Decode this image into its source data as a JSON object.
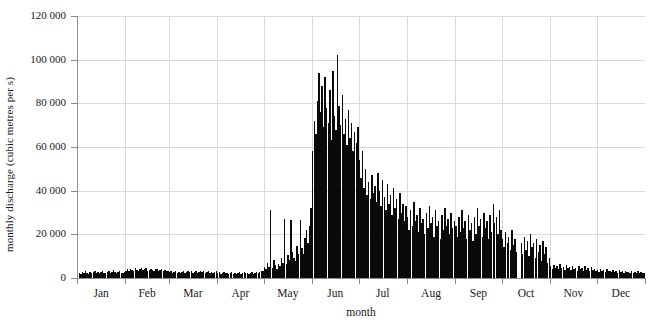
{
  "chart_data": {
    "type": "bar",
    "title": "",
    "subtitle": "",
    "xlabel": "month",
    "ylabel": "monthly discharge (cubic metres per s)",
    "xlim": [
      0,
      365
    ],
    "ylim": [
      0,
      120000
    ],
    "grid": true,
    "legend": null,
    "y_ticks": [
      0,
      20000,
      40000,
      60000,
      80000,
      100000,
      120000
    ],
    "y_tick_labels": [
      "0",
      "20 000",
      "40 000",
      "60 000",
      "80 000",
      "100 000",
      "120 000"
    ],
    "x_tick_labels": [
      "Jan",
      "Feb",
      "Mar",
      "Apr",
      "May",
      "Jun",
      "Jul",
      "Aug",
      "Sep",
      "Oct",
      "Nov",
      "Dec"
    ],
    "x_tick_positions_days": [
      15,
      46,
      74,
      105,
      135,
      166,
      196,
      227,
      258,
      288,
      319,
      349
    ],
    "month_boundaries_days": [
      0,
      31,
      59,
      90,
      120,
      151,
      181,
      212,
      243,
      273,
      304,
      334,
      365
    ],
    "bar_color": "#0a0a0a",
    "grid_color": "#d9d9d9",
    "axis_color": "#909090",
    "annotations": [
      "isolated spikes in early and mid May reaching ~31 000 and ~27 000",
      "peak discharge ~102 000 in early June",
      "narrow data gap in early October"
    ],
    "categories": [
      "1-Jan",
      "2-Jan",
      "3-Jan",
      "4-Jan",
      "5-Jan",
      "6-Jan",
      "7-Jan",
      "8-Jan",
      "9-Jan",
      "10-Jan",
      "11-Jan",
      "12-Jan",
      "13-Jan",
      "14-Jan",
      "15-Jan",
      "16-Jan",
      "17-Jan",
      "18-Jan",
      "19-Jan",
      "20-Jan",
      "21-Jan",
      "22-Jan",
      "23-Jan",
      "24-Jan",
      "25-Jan",
      "26-Jan",
      "27-Jan",
      "28-Jan",
      "29-Jan",
      "30-Jan",
      "31-Jan",
      "1-Feb",
      "2-Feb",
      "3-Feb",
      "4-Feb",
      "5-Feb",
      "6-Feb",
      "7-Feb",
      "8-Feb",
      "9-Feb",
      "10-Feb",
      "11-Feb",
      "12-Feb",
      "13-Feb",
      "14-Feb",
      "15-Feb",
      "16-Feb",
      "17-Feb",
      "18-Feb",
      "19-Feb",
      "20-Feb",
      "21-Feb",
      "22-Feb",
      "23-Feb",
      "24-Feb",
      "25-Feb",
      "26-Feb",
      "27-Feb",
      "28-Feb",
      "1-Mar",
      "2-Mar",
      "3-Mar",
      "4-Mar",
      "5-Mar",
      "6-Mar",
      "7-Mar",
      "8-Mar",
      "9-Mar",
      "10-Mar",
      "11-Mar",
      "12-Mar",
      "13-Mar",
      "14-Mar",
      "15-Mar",
      "16-Mar",
      "17-Mar",
      "18-Mar",
      "19-Mar",
      "20-Mar",
      "21-Mar",
      "22-Mar",
      "23-Mar",
      "24-Mar",
      "25-Mar",
      "26-Mar",
      "27-Mar",
      "28-Mar",
      "29-Mar",
      "30-Mar",
      "31-Mar",
      "1-Apr",
      "2-Apr",
      "3-Apr",
      "4-Apr",
      "5-Apr",
      "6-Apr",
      "7-Apr",
      "8-Apr",
      "9-Apr",
      "10-Apr",
      "11-Apr",
      "12-Apr",
      "13-Apr",
      "14-Apr",
      "15-Apr",
      "16-Apr",
      "17-Apr",
      "18-Apr",
      "19-Apr",
      "20-Apr",
      "21-Apr",
      "22-Apr",
      "23-Apr",
      "24-Apr",
      "25-Apr",
      "26-Apr",
      "27-Apr",
      "28-Apr",
      "29-Apr",
      "30-Apr",
      "1-May",
      "2-May",
      "3-May",
      "4-May",
      "5-May",
      "6-May",
      "7-May",
      "8-May",
      "9-May",
      "10-May",
      "11-May",
      "12-May",
      "13-May",
      "14-May",
      "15-May",
      "16-May",
      "17-May",
      "18-May",
      "19-May",
      "20-May",
      "21-May",
      "22-May",
      "23-May",
      "24-May",
      "25-May",
      "26-May",
      "27-May",
      "28-May",
      "29-May",
      "30-May",
      "31-May",
      "1-Jun",
      "2-Jun",
      "3-Jun",
      "4-Jun",
      "5-Jun",
      "6-Jun",
      "7-Jun",
      "8-Jun",
      "9-Jun",
      "10-Jun",
      "11-Jun",
      "12-Jun",
      "13-Jun",
      "14-Jun",
      "15-Jun",
      "16-Jun",
      "17-Jun",
      "18-Jun",
      "19-Jun",
      "20-Jun",
      "21-Jun",
      "22-Jun",
      "23-Jun",
      "24-Jun",
      "25-Jun",
      "26-Jun",
      "27-Jun",
      "28-Jun",
      "29-Jun",
      "30-Jun",
      "1-Jul",
      "2-Jul",
      "3-Jul",
      "4-Jul",
      "5-Jul",
      "6-Jul",
      "7-Jul",
      "8-Jul",
      "9-Jul",
      "10-Jul",
      "11-Jul",
      "12-Jul",
      "13-Jul",
      "14-Jul",
      "15-Jul",
      "16-Jul",
      "17-Jul",
      "18-Jul",
      "19-Jul",
      "20-Jul",
      "21-Jul",
      "22-Jul",
      "23-Jul",
      "24-Jul",
      "25-Jul",
      "26-Jul",
      "27-Jul",
      "28-Jul",
      "29-Jul",
      "30-Jul",
      "31-Jul",
      "1-Aug",
      "2-Aug",
      "3-Aug",
      "4-Aug",
      "5-Aug",
      "6-Aug",
      "7-Aug",
      "8-Aug",
      "9-Aug",
      "10-Aug",
      "11-Aug",
      "12-Aug",
      "13-Aug",
      "14-Aug",
      "15-Aug",
      "16-Aug",
      "17-Aug",
      "18-Aug",
      "19-Aug",
      "20-Aug",
      "21-Aug",
      "22-Aug",
      "23-Aug",
      "24-Aug",
      "25-Aug",
      "26-Aug",
      "27-Aug",
      "28-Aug",
      "29-Aug",
      "30-Aug",
      "31-Aug",
      "1-Sep",
      "2-Sep",
      "3-Sep",
      "4-Sep",
      "5-Sep",
      "6-Sep",
      "7-Sep",
      "8-Sep",
      "9-Sep",
      "10-Sep",
      "11-Sep",
      "12-Sep",
      "13-Sep",
      "14-Sep",
      "15-Sep",
      "16-Sep",
      "17-Sep",
      "18-Sep",
      "19-Sep",
      "20-Sep",
      "21-Sep",
      "22-Sep",
      "23-Sep",
      "24-Sep",
      "25-Sep",
      "26-Sep",
      "27-Sep",
      "28-Sep",
      "29-Sep",
      "30-Sep",
      "1-Oct",
      "2-Oct",
      "3-Oct",
      "4-Oct",
      "5-Oct",
      "6-Oct",
      "7-Oct",
      "8-Oct",
      "9-Oct",
      "10-Oct",
      "11-Oct",
      "12-Oct",
      "13-Oct",
      "14-Oct",
      "15-Oct",
      "16-Oct",
      "17-Oct",
      "18-Oct",
      "19-Oct",
      "20-Oct",
      "21-Oct",
      "22-Oct",
      "23-Oct",
      "24-Oct",
      "25-Oct",
      "26-Oct",
      "27-Oct",
      "28-Oct",
      "29-Oct",
      "30-Oct",
      "31-Oct",
      "1-Nov",
      "2-Nov",
      "3-Nov",
      "4-Nov",
      "5-Nov",
      "6-Nov",
      "7-Nov",
      "8-Nov",
      "9-Nov",
      "10-Nov",
      "11-Nov",
      "12-Nov",
      "13-Nov",
      "14-Nov",
      "15-Nov",
      "16-Nov",
      "17-Nov",
      "18-Nov",
      "19-Nov",
      "20-Nov",
      "21-Nov",
      "22-Nov",
      "23-Nov",
      "24-Nov",
      "25-Nov",
      "26-Nov",
      "27-Nov",
      "28-Nov",
      "29-Nov",
      "30-Nov",
      "1-Dec",
      "2-Dec",
      "3-Dec",
      "4-Dec",
      "5-Dec",
      "6-Dec",
      "7-Dec",
      "8-Dec",
      "9-Dec",
      "10-Dec",
      "11-Dec",
      "12-Dec",
      "13-Dec",
      "14-Dec",
      "15-Dec",
      "16-Dec",
      "17-Dec",
      "18-Dec",
      "19-Dec",
      "20-Dec",
      "21-Dec",
      "22-Dec",
      "23-Dec",
      "24-Dec",
      "25-Dec",
      "26-Dec",
      "27-Dec",
      "28-Dec",
      "29-Dec",
      "30-Dec",
      "31-Dec"
    ],
    "values": [
      2100,
      2400,
      1900,
      2600,
      2200,
      3000,
      2500,
      2000,
      2800,
      2300,
      2700,
      3100,
      2400,
      2900,
      2200,
      2600,
      3300,
      2500,
      2100,
      2800,
      3000,
      2400,
      2700,
      3500,
      2900,
      2300,
      2600,
      3100,
      2500,
      2200,
      2700,
      3400,
      3900,
      3100,
      4200,
      3600,
      3000,
      4500,
      3800,
      3200,
      4100,
      4600,
      3500,
      4000,
      4400,
      3300,
      3800,
      4200,
      3600,
      3100,
      3900,
      4300,
      3400,
      3700,
      4100,
      3200,
      3500,
      3000,
      3300,
      2600,
      3000,
      2400,
      2800,
      3200,
      2500,
      2900,
      2300,
      2700,
      3100,
      2400,
      2800,
      3300,
      2600,
      3000,
      2200,
      2700,
      3100,
      2500,
      2900,
      3400,
      2600,
      3000,
      2300,
      2800,
      3200,
      2500,
      2900,
      2400,
      2700,
      3100,
      2200,
      2600,
      2000,
      2400,
      2800,
      2100,
      2500,
      1900,
      2300,
      2700,
      2000,
      2400,
      1800,
      2200,
      2600,
      1900,
      2300,
      2700,
      2100,
      2500,
      1800,
      2200,
      2600,
      2000,
      2400,
      2900,
      2200,
      2600,
      3000,
      3400,
      5200,
      4300,
      6800,
      5100,
      31000,
      4600,
      8200,
      5800,
      4200,
      6500,
      5300,
      9200,
      7100,
      27000,
      6300,
      10500,
      8400,
      26800,
      12000,
      9100,
      7800,
      14500,
      11200,
      26500,
      13800,
      10900,
      18500,
      22000,
      16000,
      24000,
      32000,
      58000,
      72000,
      66000,
      81000,
      94000,
      76000,
      88000,
      69000,
      92000,
      78000,
      71000,
      86000,
      63000,
      95000,
      74000,
      68000,
      102000,
      79000,
      70000,
      84000,
      66000,
      73000,
      61000,
      77000,
      64000,
      71000,
      58000,
      67000,
      62000,
      69000,
      54000,
      46000,
      58000,
      41000,
      50000,
      38000,
      44000,
      36000,
      47000,
      39000,
      42000,
      35000,
      48000,
      40000,
      33000,
      45000,
      37000,
      31000,
      43000,
      34000,
      38000,
      29000,
      41000,
      32000,
      36000,
      27000,
      39000,
      30000,
      34000,
      26000,
      33000,
      28000,
      22000,
      31000,
      24000,
      35000,
      26000,
      29000,
      21000,
      32000,
      25000,
      27000,
      20000,
      30000,
      23000,
      33000,
      25000,
      28000,
      19000,
      31000,
      24000,
      26000,
      18000,
      29000,
      22000,
      32000,
      24000,
      27000,
      20000,
      30000,
      23000,
      26000,
      24000,
      19000,
      28000,
      21000,
      31000,
      23000,
      26000,
      18000,
      29000,
      22000,
      25000,
      17000,
      28000,
      20000,
      32000,
      24000,
      27000,
      19000,
      30000,
      23000,
      26000,
      18000,
      29000,
      21000,
      34000,
      25000,
      28000,
      20000,
      31000,
      22000,
      18000,
      14000,
      21000,
      16000,
      19000,
      13000,
      22000,
      15000,
      18000,
      12000,
      0,
      0,
      16000,
      11000,
      19000,
      13000,
      17000,
      10000,
      20000,
      14000,
      16000,
      9000,
      18000,
      12000,
      15000,
      8000,
      17000,
      11000,
      14000,
      7000,
      9000,
      5400,
      4200,
      6100,
      4800,
      5600,
      4000,
      6300,
      4600,
      5200,
      3800,
      5900,
      4400,
      5000,
      3600,
      5700,
      4100,
      4800,
      3400,
      5500,
      3900,
      4600,
      3200,
      5300,
      3700,
      4400,
      3100,
      5100,
      3600,
      4200,
      3000,
      3800,
      2900,
      4100,
      3200,
      3500,
      2700,
      3900,
      3000,
      3400,
      2600,
      3700,
      2800,
      3200,
      2500,
      3600,
      2700,
      3100,
      2400,
      3400,
      2600,
      2900,
      2300,
      3300,
      2500,
      2800,
      2200,
      3100,
      2400,
      2700,
      2100,
      2500
    ]
  }
}
